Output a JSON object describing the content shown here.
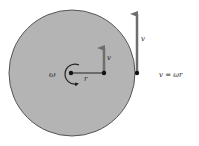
{
  "diagram": {
    "labels": {
      "omega": "ω",
      "radius": "r",
      "velocity_inner": "v",
      "velocity_edge": "v",
      "equation": "v = ωr"
    },
    "colors": {
      "disk_fill": "#b4b4b4",
      "disk_stroke": "#555555",
      "arrow": "#6e6e6e",
      "point": "#111111"
    }
  }
}
